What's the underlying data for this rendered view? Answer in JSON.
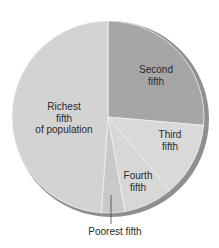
{
  "chart_data": {
    "type": "pie",
    "title": "",
    "start_angle_deg": 0,
    "direction": "clockwise",
    "slices": [
      {
        "label": "Second fifth",
        "value": 26.4,
        "color": "#a6a6a6"
      },
      {
        "label": "Third fifth",
        "value": 12.5,
        "color": "#d9d9d9"
      },
      {
        "label": "Fourth fifth",
        "value": 8.3,
        "color": "#d7d7d7"
      },
      {
        "label": "Poorest fifth",
        "value": 3.9,
        "color": "#c9c9c9"
      },
      {
        "label": "Richest fifth of population",
        "value": 48.9,
        "color": "#d3d3d3"
      }
    ],
    "categories": [
      "Second fifth",
      "Third fifth",
      "Fourth fifth",
      "Poorest fifth",
      "Richest fifth of population"
    ],
    "values": [
      26.4,
      12.5,
      8.3,
      3.9,
      48.9
    ],
    "units": "percent (estimated from slice angles)",
    "rim_color": "#8f8f8f",
    "separator_color": "#f2f2f2"
  },
  "labels": {
    "second": [
      "Second",
      "fifth"
    ],
    "third": [
      "Third",
      "fifth"
    ],
    "fourth": [
      "Fourth",
      "fifth"
    ],
    "poorest": "Poorest fifth",
    "richest": [
      "Richest",
      "fifth",
      "of population"
    ]
  }
}
